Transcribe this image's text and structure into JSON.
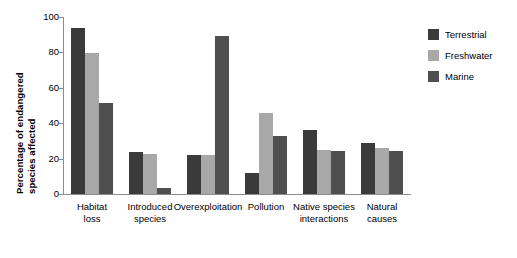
{
  "chart_data": {
    "type": "bar",
    "title": "",
    "subtitle": "",
    "xlabel": "",
    "ylabel_lines": [
      "Percentage of endangered",
      "species affected"
    ],
    "ylabel": "Percentage of endangered species affected",
    "ylim": [
      0,
      100
    ],
    "yticks": [
      0,
      20,
      40,
      60,
      80,
      100
    ],
    "ytick_labels": [
      "0",
      "20",
      "40",
      "60",
      "80",
      "100"
    ],
    "grid": false,
    "legend_position": "top-right",
    "categories": [
      "Habitat\nloss",
      "Introduced\nspecies",
      "Overexploitation",
      "Pollution",
      "Native species\ninteractions",
      "Natural\ncauses"
    ],
    "series": [
      {
        "name": "Terrestrial",
        "color": "#3a3a3a",
        "values": [
          94,
          24,
          22,
          12,
          36,
          29
        ]
      },
      {
        "name": "Freshwater",
        "color": "#a8a8a8",
        "values": [
          79.5,
          22.5,
          22,
          46,
          25,
          26
        ]
      },
      {
        "name": "Marine",
        "color": "#4f4f4f",
        "values": [
          51.5,
          3.5,
          89,
          33,
          24.5,
          24.5
        ]
      }
    ]
  },
  "legend": {
    "items": [
      {
        "label": "Terrestrial",
        "color": "#3a3a3a"
      },
      {
        "label": "Freshwater",
        "color": "#a8a8a8"
      },
      {
        "label": "Marine",
        "color": "#4f4f4f"
      }
    ]
  },
  "axis": {
    "tick_labels": [
      "100",
      "80",
      "60",
      "40",
      "20",
      "0"
    ]
  }
}
